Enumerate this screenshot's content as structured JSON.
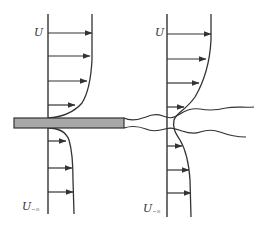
{
  "diagram": {
    "colors": {
      "line": "#333333",
      "plate_fill": "#a8a8a8",
      "plate_stroke": "#333333",
      "background": "#ffffff"
    },
    "labels": {
      "left_top": "U",
      "left_bottom_main": "U",
      "left_bottom_sub": "−∞",
      "right_top": "U",
      "right_bottom_main": "U",
      "right_bottom_sub": "−∞"
    },
    "plate": {
      "x_start": 14,
      "x_end": 124,
      "y_top": 118,
      "y_bottom": 128
    },
    "left_profile": {
      "axis_x": 48,
      "axis_y_top": 14,
      "axis_y_bottom": 214,
      "upper_arrows": [
        {
          "y": 33,
          "x_end": 92
        },
        {
          "y": 56,
          "x_end": 90
        },
        {
          "y": 81,
          "x_end": 87
        },
        {
          "y": 105,
          "x_end": 75
        }
      ],
      "lower_arrows": [
        {
          "y": 141,
          "x_end": 66
        },
        {
          "y": 168,
          "x_end": 72
        },
        {
          "y": 192,
          "x_end": 73
        }
      ]
    },
    "right_profile": {
      "axis_x": 167,
      "axis_y_top": 14,
      "axis_y_bottom": 217,
      "upper_arrows": [
        {
          "y": 34,
          "x_end": 211
        },
        {
          "y": 59,
          "x_end": 206
        },
        {
          "y": 83,
          "x_end": 199
        },
        {
          "y": 107,
          "x_end": 184
        }
      ],
      "lower_arrows": [
        {
          "y": 146,
          "x_end": 182
        },
        {
          "y": 170,
          "x_end": 189
        },
        {
          "y": 193,
          "x_end": 191
        }
      ]
    }
  }
}
